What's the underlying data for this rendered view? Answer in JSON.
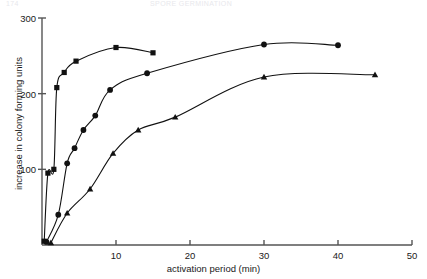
{
  "page": {
    "header_left": "174",
    "header_center": "SPORE GERMINATION"
  },
  "chart_data": {
    "type": "line",
    "title": "",
    "subtitle": "",
    "xlabel": "activation period (min)",
    "ylabel": "increase in colony forming units",
    "xlim": [
      0,
      50
    ],
    "ylim": [
      0,
      300
    ],
    "xticks": [
      10,
      20,
      30,
      40,
      50
    ],
    "yticks": [
      100,
      200,
      300
    ],
    "grid": false,
    "legend": "none",
    "axis_style": "open-left-bottom",
    "colors": {
      "ink": "#1a1a1a",
      "axis": "#555555"
    },
    "series": [
      {
        "name": "squares",
        "marker": "square",
        "color": "#111111",
        "points": [
          {
            "x": 0.3,
            "y": 5
          },
          {
            "x": 0.8,
            "y": 95
          },
          {
            "x": 1.6,
            "y": 100
          },
          {
            "x": 2.0,
            "y": 208
          },
          {
            "x": 3.0,
            "y": 228
          },
          {
            "x": 4.6,
            "y": 243
          },
          {
            "x": 10.0,
            "y": 261
          },
          {
            "x": 15.0,
            "y": 254
          }
        ]
      },
      {
        "name": "circles",
        "marker": "circle",
        "color": "#111111",
        "points": [
          {
            "x": 0.6,
            "y": 4
          },
          {
            "x": 2.2,
            "y": 40
          },
          {
            "x": 3.4,
            "y": 108
          },
          {
            "x": 4.4,
            "y": 128
          },
          {
            "x": 5.6,
            "y": 152
          },
          {
            "x": 7.2,
            "y": 171
          },
          {
            "x": 9.2,
            "y": 205
          },
          {
            "x": 14.2,
            "y": 227
          },
          {
            "x": 30.0,
            "y": 265
          },
          {
            "x": 40.0,
            "y": 264
          }
        ]
      },
      {
        "name": "triangles",
        "marker": "triangle",
        "color": "#111111",
        "points": [
          {
            "x": 1.2,
            "y": 3
          },
          {
            "x": 3.4,
            "y": 42
          },
          {
            "x": 6.5,
            "y": 74
          },
          {
            "x": 9.6,
            "y": 121
          },
          {
            "x": 13.0,
            "y": 152
          },
          {
            "x": 18.0,
            "y": 169
          },
          {
            "x": 30.0,
            "y": 222
          },
          {
            "x": 45.0,
            "y": 225
          }
        ]
      }
    ]
  }
}
